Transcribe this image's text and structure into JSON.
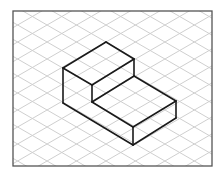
{
  "diagram": {
    "type": "isometric-drawing",
    "frame": {
      "x": 13,
      "y": 11,
      "width": 199,
      "height": 155,
      "stroke": "#555555"
    },
    "grid": {
      "color": "#cfcfcf",
      "spacing_y": 17,
      "slope": 0.577
    },
    "object": {
      "stroke": "#1a1a1a",
      "stroke_width": 1.6,
      "edges": [
        [
          [
            106,
            42
          ],
          [
            63,
            68
          ]
        ],
        [
          [
            106,
            42
          ],
          [
            134,
            59
          ]
        ],
        [
          [
            63,
            68
          ],
          [
            92,
            85
          ]
        ],
        [
          [
            134,
            59
          ],
          [
            92,
            85
          ]
        ],
        [
          [
            134,
            59
          ],
          [
            134,
            76
          ]
        ],
        [
          [
            63,
            68
          ],
          [
            63,
            103
          ]
        ],
        [
          [
            92,
            85
          ],
          [
            92,
            102
          ]
        ],
        [
          [
            134,
            76
          ],
          [
            92,
            102
          ]
        ],
        [
          [
            134,
            76
          ],
          [
            176,
            101
          ]
        ],
        [
          [
            92,
            102
          ],
          [
            133,
            127
          ]
        ],
        [
          [
            176,
            101
          ],
          [
            133,
            127
          ]
        ],
        [
          [
            63,
            103
          ],
          [
            133,
            145
          ]
        ],
        [
          [
            133,
            127
          ],
          [
            133,
            145
          ]
        ],
        [
          [
            176,
            101
          ],
          [
            176,
            118
          ]
        ],
        [
          [
            176,
            118
          ],
          [
            133,
            145
          ]
        ]
      ]
    }
  }
}
